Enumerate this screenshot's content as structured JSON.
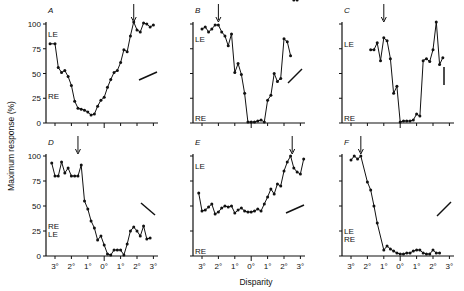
{
  "chart_data": {
    "type": "line",
    "ylabel": "Maximum response (%)",
    "xlabel": "Disparity",
    "x_ticks": [
      "3°",
      "2°",
      "1°",
      "0°",
      "1°",
      "2°",
      "3°"
    ],
    "y_ticks": [
      0,
      25,
      50,
      75,
      100
    ],
    "panels": [
      {
        "id": "A",
        "row": 0,
        "col": 0,
        "le_label": "LE",
        "re_label": "RE",
        "le_y": 90,
        "re_y": 27,
        "arrow_x": 1.8,
        "orientation": "shallow-positive",
        "x": [
          -3.3,
          -3.0,
          -2.8,
          -2.6,
          -2.4,
          -2.2,
          -2.0,
          -1.8,
          -1.6,
          -1.4,
          -1.2,
          -1.0,
          -0.8,
          -0.6,
          -0.4,
          -0.2,
          0.0,
          0.2,
          0.4,
          0.6,
          0.8,
          1.0,
          1.2,
          1.4,
          1.6,
          1.8,
          2.0,
          2.2,
          2.4,
          2.6,
          2.8,
          3.0
        ],
        "y": [
          80,
          80,
          56,
          51,
          53,
          47,
          38,
          22,
          15,
          14,
          13,
          11,
          8,
          9,
          17,
          23,
          26,
          36,
          44,
          51,
          53,
          61,
          74,
          72,
          88,
          102,
          94,
          92,
          101,
          100,
          97,
          99
        ]
      },
      {
        "id": "B",
        "row": 0,
        "col": 1,
        "le_label": "LE",
        "re_label": "RE",
        "le_y": 85,
        "re_y": 5,
        "arrow_x": -2.0,
        "orientation": "steep-positive",
        "x": [
          -3.0,
          -2.8,
          -2.6,
          -2.4,
          -2.2,
          -2.0,
          -1.8,
          -1.6,
          -1.4,
          -1.2,
          -1.0,
          -0.8,
          -0.6,
          -0.4,
          -0.2,
          0.0,
          0.2,
          0.4,
          0.6,
          0.8,
          1.0,
          1.2,
          1.4,
          1.6,
          1.8,
          2.0,
          2.2,
          2.4,
          2.6,
          2.8
        ],
        "y": [
          95,
          97,
          92,
          95,
          99,
          99,
          92,
          88,
          78,
          90,
          51,
          60,
          49,
          30,
          1,
          1,
          1,
          2,
          3,
          1,
          23,
          28,
          50,
          42,
          45,
          85,
          82,
          68
        ]
      },
      {
        "id": "C",
        "row": 0,
        "col": 2,
        "le_label": "LE",
        "re_label": "RE",
        "le_y": 80,
        "re_y": 5,
        "arrow_x": -1.0,
        "orientation": "vertical",
        "x": [
          -1.8,
          -1.6,
          -1.4,
          -1.2,
          -1.0,
          -0.8,
          -0.6,
          -0.4,
          -0.2,
          0.0,
          0.2,
          0.4,
          0.6,
          0.8,
          1.0,
          1.2,
          1.4,
          1.6,
          1.8,
          2.0,
          2.2,
          2.4,
          2.6
        ],
        "y": [
          74,
          74,
          81,
          63,
          86,
          83,
          65,
          30,
          37,
          1,
          2,
          2,
          2,
          3,
          9,
          7,
          63,
          65,
          62,
          74,
          102,
          59,
          66
        ]
      },
      {
        "id": "D",
        "row": 1,
        "col": 0,
        "le_label": "LE",
        "re_label": "RE",
        "le_y": 22,
        "re_y": 30,
        "arrow_x": -1.6,
        "orientation": "negative-diagonal",
        "x": [
          -3.2,
          -3.0,
          -2.8,
          -2.6,
          -2.4,
          -2.2,
          -2.0,
          -1.8,
          -1.6,
          -1.4,
          -1.2,
          -1.0,
          -0.8,
          -0.6,
          -0.4,
          -0.2,
          0.0,
          0.2,
          0.4,
          0.6,
          0.8,
          1.0,
          1.2,
          1.4,
          1.6,
          1.8,
          2.0,
          2.2,
          2.4,
          2.6,
          2.8
        ],
        "y": [
          93,
          80,
          80,
          94,
          83,
          88,
          80,
          80,
          80,
          91,
          55,
          47,
          35,
          28,
          16,
          20,
          11,
          2,
          1,
          6,
          6,
          6,
          1,
          12,
          25,
          29,
          25,
          20,
          30,
          17,
          18
        ]
      },
      {
        "id": "E",
        "row": 1,
        "col": 1,
        "le_label": "LE",
        "re_label": "RE",
        "le_y": 90,
        "re_y": 5,
        "arrow_x": 2.5,
        "orientation": "shallow-positive",
        "x": [
          -3.2,
          -3.0,
          -2.8,
          -2.6,
          -2.4,
          -2.2,
          -2.0,
          -1.8,
          -1.6,
          -1.4,
          -1.2,
          -1.0,
          -0.8,
          -0.6,
          -0.4,
          -0.2,
          0.0,
          0.2,
          0.4,
          0.6,
          0.8,
          1.0,
          1.2,
          1.4,
          1.6,
          1.8,
          2.0,
          2.2,
          2.4,
          2.6,
          2.8,
          3.0,
          3.2
        ],
        "y": [
          63,
          45,
          46,
          49,
          52,
          42,
          44,
          48,
          50,
          49,
          50,
          43,
          46,
          48,
          45,
          44,
          44,
          45,
          47,
          45,
          52,
          59,
          67,
          62,
          72,
          70,
          85,
          94,
          100,
          88,
          84,
          82,
          97
        ]
      },
      {
        "id": "F",
        "row": 1,
        "col": 2,
        "le_label": "LE",
        "re_label": "RE",
        "le_y": 25,
        "re_y": 17,
        "arrow_x": -2.4,
        "orientation": "steep-positive",
        "x": [
          -3.0,
          -2.8,
          -2.6,
          -2.4,
          -2.0,
          -1.8,
          -1.6,
          -1.4,
          -1.0,
          -0.8,
          -0.6,
          -0.4,
          -0.2,
          0.0,
          0.2,
          0.4,
          0.6,
          0.8,
          1.0,
          1.2,
          1.4,
          1.6,
          1.8,
          2.0,
          2.2,
          2.4
        ],
        "y": [
          96,
          100,
          97,
          100,
          74,
          66,
          50,
          33,
          6,
          10,
          7,
          5,
          3,
          2,
          2,
          3,
          3,
          5,
          6,
          6,
          3,
          2,
          2,
          6,
          3,
          3
        ]
      }
    ]
  },
  "labels": {
    "ylabel": "Maximum response (%)",
    "xlabel": "Disparity",
    "panel_titles": [
      "A",
      "B",
      "C",
      "D",
      "E",
      "F"
    ]
  }
}
